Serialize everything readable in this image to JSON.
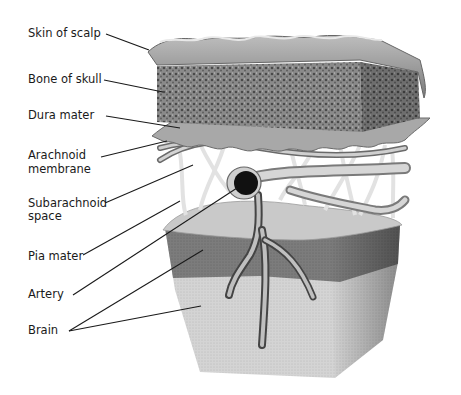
{
  "diagram": {
    "type": "anatomical cross-section",
    "labels": [
      {
        "id": "skin",
        "text": "Skin of scalp"
      },
      {
        "id": "bone",
        "text": "Bone of skull"
      },
      {
        "id": "dura",
        "text": "Dura mater"
      },
      {
        "id": "arachnoid_1",
        "text": "Arachnoid"
      },
      {
        "id": "arachnoid_2",
        "text": "membrane"
      },
      {
        "id": "subarachnoid_1",
        "text": "Subarachnoid"
      },
      {
        "id": "subarachnoid_2",
        "text": "space"
      },
      {
        "id": "pia",
        "text": "Pia mater"
      },
      {
        "id": "artery",
        "text": "Artery"
      },
      {
        "id": "brain",
        "text": "Brain"
      }
    ],
    "colors": {
      "skin": "#9a9a9a",
      "bone": "#7d7d7d",
      "dura": "#a6a6a6",
      "web": "#e4e4e4",
      "pia_gray": "#7a7a7a",
      "brain_white": "#d2d2d2",
      "leader": "#1a1a1a"
    }
  }
}
